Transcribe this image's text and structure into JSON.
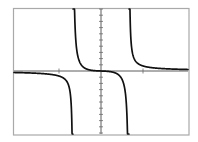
{
  "chart_data": {
    "type": "line",
    "title": "",
    "xlabel": "",
    "ylabel": "",
    "function": "y = k * x / (x^2 - 1)",
    "vertical_asymptotes": [
      -1,
      1
    ],
    "horizontal_asymptote": 0,
    "xlim": [
      -3.1,
      3.1
    ],
    "ylim": [
      -11,
      11
    ],
    "x_ticks": [
      -1.5,
      1.5
    ],
    "y_tick_step": 1,
    "y_ticks_count_each_side": 10,
    "grid": false,
    "legend": false,
    "series": [
      {
        "name": "left branch",
        "x_range": [
          -3.1,
          -1.0
        ],
        "behavior": "y < 0, approaches 0 from below as x -> -inf, -> -inf as x -> -1-"
      },
      {
        "name": "middle branch",
        "x_range": [
          -1.0,
          1.0
        ],
        "behavior": "decreasing from +inf to -inf through (0,0)"
      },
      {
        "name": "right branch",
        "x_range": [
          1.0,
          3.1
        ],
        "behavior": "y > 0, -> +inf as x -> 1+, approaches 0 from above"
      }
    ],
    "colors": {
      "curve": "#111111",
      "axes": "#4a4a4a",
      "frame": "#a9a9a9",
      "background": "#ffffff"
    }
  }
}
